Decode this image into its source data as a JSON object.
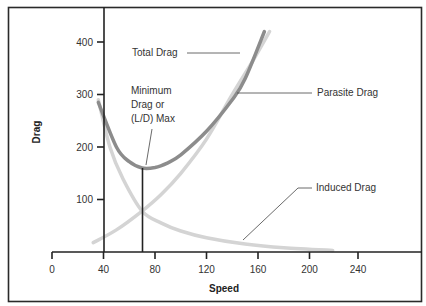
{
  "chart_data": {
    "type": "line",
    "title": "",
    "xlabel": "Speed",
    "ylabel": "Drag",
    "xlim": [
      0,
      260
    ],
    "ylim": [
      0,
      420
    ],
    "x_ticks": [
      0,
      40,
      80,
      120,
      160,
      200,
      240
    ],
    "y_ticks": [
      100,
      200,
      300,
      400
    ],
    "grid": false,
    "series": [
      {
        "name": "Total Drag",
        "color": "#8c8c8c",
        "points": [
          [
            36,
            285
          ],
          [
            50,
            200
          ],
          [
            60,
            172
          ],
          [
            70,
            160
          ],
          [
            80,
            161
          ],
          [
            90,
            170
          ],
          [
            100,
            185
          ],
          [
            120,
            230
          ],
          [
            140,
            290
          ],
          [
            150,
            330
          ],
          [
            165,
            420
          ]
        ]
      },
      {
        "name": "Parasite Drag",
        "color": "#d4d4d4",
        "points": [
          [
            32,
            18
          ],
          [
            50,
            42
          ],
          [
            70,
            78
          ],
          [
            85,
            110
          ],
          [
            100,
            150
          ],
          [
            120,
            215
          ],
          [
            140,
            300
          ],
          [
            155,
            360
          ],
          [
            169,
            420
          ]
        ]
      },
      {
        "name": "Induced Drag",
        "color": "#d4d4d4",
        "points": [
          [
            36,
            290
          ],
          [
            45,
            200
          ],
          [
            55,
            140
          ],
          [
            70,
            78
          ],
          [
            85,
            55
          ],
          [
            100,
            40
          ],
          [
            120,
            27
          ],
          [
            150,
            15
          ],
          [
            180,
            8
          ],
          [
            218,
            3
          ]
        ]
      }
    ],
    "annotations": [
      {
        "text": "Total Drag",
        "target_series": "Total Drag"
      },
      {
        "text": "Parasite Drag",
        "target_series": "Parasite Drag"
      },
      {
        "text": "Induced Drag",
        "target_series": "Induced Drag"
      },
      {
        "text": "Minimum Drag or (L/D) Max",
        "x": 70,
        "y": 160
      }
    ],
    "reference_lines": [
      {
        "type": "vertical",
        "x": 70,
        "from_y": 0,
        "to_y": 160,
        "label": "Minimum Drag or (L/D) Max"
      }
    ],
    "legend_position": "inline-annotations"
  },
  "labels": {
    "total_drag": "Total Drag",
    "parasite_drag": "Parasite Drag",
    "induced_drag": "Induced Drag",
    "min_line1": "Minimum",
    "min_line2": "Drag or",
    "min_line3": "(L/D) Max",
    "xlabel": "Speed",
    "ylabel": "Drag"
  },
  "ticks": {
    "x": [
      "0",
      "40",
      "80",
      "120",
      "160",
      "200",
      "240"
    ],
    "y": [
      "100",
      "200",
      "300",
      "400"
    ]
  }
}
